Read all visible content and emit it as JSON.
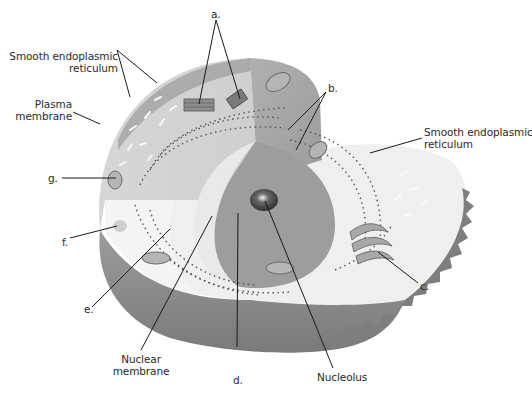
{
  "figure": {
    "colors": {
      "background": "#ffffff",
      "cell_top_light": "#d8d8d8",
      "cell_top_dark": "#a9a9a9",
      "cell_cut_face": "#efefef",
      "cell_outer_wall": "#8a8a8a",
      "nucleus": "#9a9a9a",
      "nucleolus": "#3a3a3a",
      "leader_line": "#1a1a1a",
      "text": "#2a2a2a"
    }
  },
  "labels": {
    "ser_left": {
      "line1": "Smooth endoplasmic",
      "line2": "reticulum"
    },
    "plasma_membrane": {
      "line1": "Plasma",
      "line2": "membrane"
    },
    "ser_right": {
      "line1": "Smooth endoplasmic",
      "line2": "reticulum"
    },
    "nuclear_membrane": {
      "line1": "Nuclear",
      "line2": "membrane"
    },
    "nucleolus": "Nucleolus",
    "a": "a.",
    "b": "b.",
    "c": "c.",
    "d": "d.",
    "e": "e.",
    "f": "f.",
    "g": "g."
  }
}
